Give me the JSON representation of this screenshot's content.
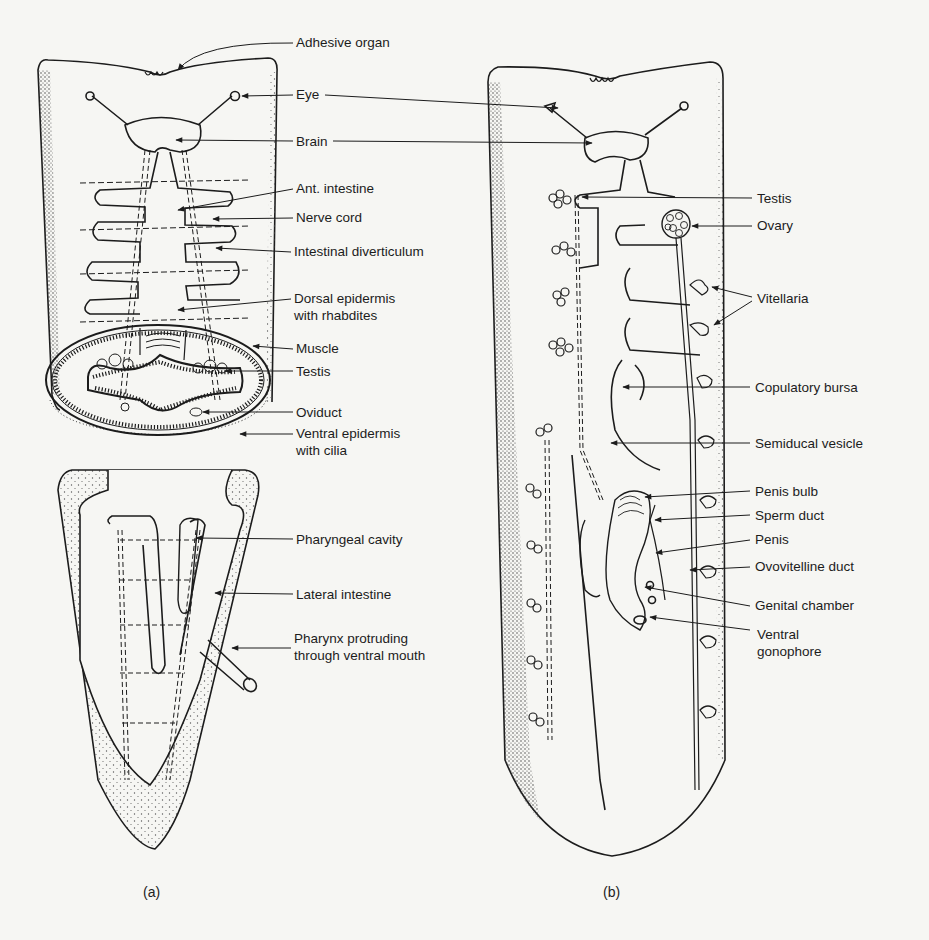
{
  "figure": {
    "panels": [
      {
        "id": "a",
        "caption": "(a)",
        "labels": [
          {
            "key": "adhesive_organ",
            "text": "Adhesive organ",
            "x": 296,
            "y": 34
          },
          {
            "key": "eye",
            "text": "Eye",
            "x": 296,
            "y": 86
          },
          {
            "key": "brain",
            "text": "Brain",
            "x": 296,
            "y": 133
          },
          {
            "key": "ant_intestine",
            "text": "Ant. intestine",
            "x": 296,
            "y": 180
          },
          {
            "key": "nerve_cord",
            "text": "Nerve cord",
            "x": 296,
            "y": 209
          },
          {
            "key": "intestinal_diverticulum",
            "text": "Intestinal diverticulum",
            "x": 294,
            "y": 243
          },
          {
            "key": "dorsal_epidermis",
            "text": "Dorsal epidermis\nwith rhabdites",
            "x": 294,
            "y": 290
          },
          {
            "key": "muscle",
            "text": "Muscle",
            "x": 296,
            "y": 340
          },
          {
            "key": "testis",
            "text": "Testis",
            "x": 296,
            "y": 363
          },
          {
            "key": "oviduct",
            "text": "Oviduct",
            "x": 296,
            "y": 404
          },
          {
            "key": "ventral_epidermis",
            "text": "Ventral epidermis\nwith cilia",
            "x": 296,
            "y": 425
          },
          {
            "key": "pharyngeal_cavity",
            "text": "Pharyngeal cavity",
            "x": 296,
            "y": 531
          },
          {
            "key": "lateral_intestine",
            "text": "Lateral intestine",
            "x": 296,
            "y": 586
          },
          {
            "key": "pharynx_protruding",
            "text": "Pharynx protruding\nthrough ventral mouth",
            "x": 294,
            "y": 630
          }
        ]
      },
      {
        "id": "b",
        "caption": "(b)",
        "labels": [
          {
            "key": "testis",
            "text": "Testis",
            "x": 757,
            "y": 190
          },
          {
            "key": "ovary",
            "text": "Ovary",
            "x": 757,
            "y": 217
          },
          {
            "key": "vitellaria",
            "text": "Vitellaria",
            "x": 757,
            "y": 290
          },
          {
            "key": "copulatory_bursa",
            "text": "Copulatory bursa",
            "x": 755,
            "y": 379
          },
          {
            "key": "semidical_vesicle",
            "text": "Semiducal vesicle",
            "x": 755,
            "y": 435
          },
          {
            "key": "penis_bulb",
            "text": "Penis bulb",
            "x": 755,
            "y": 483
          },
          {
            "key": "sperm_duct",
            "text": "Sperm duct",
            "x": 755,
            "y": 507
          },
          {
            "key": "penis",
            "text": "Penis",
            "x": 755,
            "y": 531
          },
          {
            "key": "ovovitelline_duct",
            "text": "Ovovitelline duct",
            "x": 755,
            "y": 558
          },
          {
            "key": "genital_chamber",
            "text": "Genital chamber",
            "x": 755,
            "y": 597
          },
          {
            "key": "ventral_gonophore",
            "text": "Ventral\ngonophore",
            "x": 757,
            "y": 626
          }
        ]
      }
    ]
  },
  "colors": {
    "background": "#f6f6f3",
    "ink": "#1c1c1c",
    "stipple": "#555555"
  }
}
